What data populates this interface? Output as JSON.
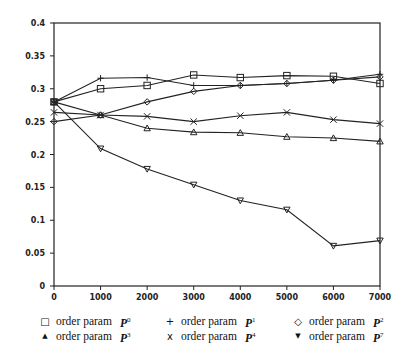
{
  "chart_data": {
    "type": "line",
    "title": "",
    "xlabel": "",
    "ylabel": "",
    "x": [
      0,
      1000,
      2000,
      3000,
      4000,
      5000,
      6000,
      7000
    ],
    "xlim": [
      0,
      7000
    ],
    "ylim": [
      0,
      0.4
    ],
    "x_ticks": [
      "0",
      "1000",
      "2000",
      "3000",
      "4000",
      "5000",
      "6000",
      "7000"
    ],
    "y_ticks": [
      "0",
      "0.05",
      "0.1",
      "0.15",
      "0.2",
      "0.25",
      "0.3",
      "0.35",
      "0.4"
    ],
    "grid": false,
    "legend_position": "bottom",
    "series": [
      {
        "name": "order param P0",
        "marker": "square",
        "values": [
          0.28,
          0.3,
          0.305,
          0.321,
          0.317,
          0.32,
          0.319,
          0.308
        ]
      },
      {
        "name": "order param P1",
        "marker": "plus",
        "values": [
          0.28,
          0.316,
          0.317,
          0.305,
          0.305,
          0.308,
          0.313,
          0.322
        ]
      },
      {
        "name": "order param P2",
        "marker": "diamond",
        "values": [
          0.25,
          0.26,
          0.28,
          0.296,
          0.305,
          0.308,
          0.313,
          0.318
        ]
      },
      {
        "name": "order param P3",
        "marker": "triangle-up",
        "values": [
          0.28,
          0.26,
          0.24,
          0.234,
          0.233,
          0.227,
          0.225,
          0.22
        ]
      },
      {
        "name": "order param P4",
        "marker": "x",
        "values": [
          0.264,
          0.26,
          0.258,
          0.25,
          0.259,
          0.264,
          0.253,
          0.247
        ]
      },
      {
        "name": "order param P7",
        "marker": "triangle-down",
        "values": [
          0.28,
          0.209,
          0.178,
          0.154,
          0.13,
          0.116,
          0.061,
          0.069
        ]
      }
    ]
  },
  "legend": {
    "rows": [
      [
        {
          "symbol": "□",
          "label": "order param",
          "param": "P",
          "sup": "0"
        },
        {
          "symbol": "+",
          "label": "order param",
          "param": "P",
          "sup": "1"
        },
        {
          "symbol": "◇",
          "label": "order param",
          "param": "P",
          "sup": "2"
        }
      ],
      [
        {
          "symbol": "▲",
          "label": "order param",
          "param": "P",
          "sup": "3"
        },
        {
          "symbol": "x",
          "label": "order param",
          "param": "P",
          "sup": "4"
        },
        {
          "symbol": "▼",
          "label": "order param",
          "param": "P",
          "sup": "7"
        }
      ]
    ]
  }
}
